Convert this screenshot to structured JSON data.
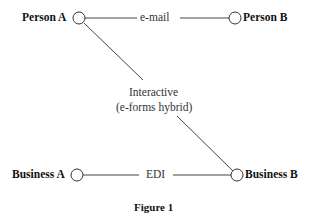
{
  "diagram": {
    "nodes": {
      "person_a": "Person A",
      "person_b": "Person B",
      "business_a": "Business A",
      "business_b": "Business B"
    },
    "edges": {
      "email": "e-mail",
      "edi": "EDI",
      "interactive_line1": "Interactive",
      "interactive_line2": "(e-forms hybrid)"
    },
    "caption": "Figure 1"
  }
}
